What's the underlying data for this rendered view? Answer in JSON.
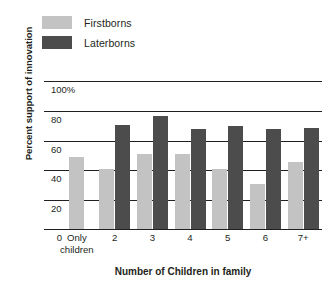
{
  "chart_data": {
    "type": "bar",
    "title": "",
    "xlabel": "Number of Children in family",
    "ylabel": "Percent support of innovation",
    "categories": [
      "Only children",
      "2",
      "3",
      "4",
      "5",
      "6",
      "7+"
    ],
    "series": [
      {
        "name": "Firstborns",
        "color": "#c3c3c3",
        "values": [
          48,
          40,
          50,
          50,
          40,
          30,
          45
        ]
      },
      {
        "name": "Laterborns",
        "color": "#4c4c4c",
        "values": [
          null,
          70,
          76,
          67,
          69,
          67,
          68
        ]
      }
    ],
    "ylim": [
      0,
      110
    ],
    "yticks": [
      {
        "value": 100,
        "label": "100%"
      },
      {
        "value": 80,
        "label": "80"
      },
      {
        "value": 60,
        "label": "60"
      },
      {
        "value": 40,
        "label": "40"
      },
      {
        "value": 20,
        "label": "20"
      },
      {
        "value": 0,
        "label": "0"
      }
    ],
    "grid": true,
    "legend_position": "top-left"
  },
  "legend": {
    "items": [
      {
        "label": "Firstborns",
        "color": "#c3c3c3"
      },
      {
        "label": "Laterborns",
        "color": "#4c4c4c"
      }
    ]
  }
}
